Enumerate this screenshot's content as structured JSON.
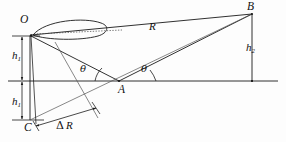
{
  "figure": {
    "type": "geometry-diagram",
    "background_color": "#fdfdfd",
    "line_color": "#1a1a1a",
    "dotted_color": "#555555"
  },
  "points": {
    "O": {
      "label": "O",
      "x": 30,
      "y": 36,
      "label_x": 20,
      "label_y": 16,
      "role": "transmitter"
    },
    "A": {
      "label": "A",
      "x": 119,
      "y": 81,
      "label_x": 115,
      "label_y": 84,
      "role": "ground-reflection-point"
    },
    "B": {
      "label": "B",
      "x": 252,
      "y": 14,
      "label_x": 248,
      "label_y": 2,
      "role": "receiver"
    },
    "C": {
      "label": "C",
      "x": 30,
      "y": 120,
      "label_x": 22,
      "label_y": 122,
      "role": "image-of-transmitter"
    }
  },
  "quantities": {
    "R": {
      "label": "R",
      "x": 150,
      "y": 22,
      "meaning": "direct path length O to B"
    },
    "h1_upper": {
      "base": "h",
      "sub": "1",
      "x": 15,
      "y": 50,
      "meaning": "transmitter height above ground"
    },
    "h1_lower": {
      "base": "h",
      "sub": "1",
      "x": 15,
      "y": 96,
      "meaning": "image depth below ground"
    },
    "h2": {
      "base": "h",
      "sub": "2",
      "x": 248,
      "y": 42,
      "meaning": "receiver height above ground"
    },
    "delta_R": {
      "delta": "Δ",
      "base": "R",
      "x": 58,
      "y": 121,
      "meaning": "path length difference"
    }
  },
  "angles": {
    "theta_left": {
      "symbol": "θ",
      "x": 82,
      "y": 65,
      "meaning": "grazing angle of incident ray at A"
    },
    "theta_right": {
      "symbol": "θ",
      "x": 142,
      "y": 65,
      "meaning": "grazing angle of reflected ray at A"
    }
  },
  "features": {
    "lobe": {
      "name": "antenna-beam-lobe",
      "from_x": 32,
      "from_y": 34,
      "to_x": 106,
      "to_y": 27
    },
    "boresight": {
      "name": "boresight-dotted-axis",
      "from_x": 33,
      "from_y": 35,
      "to_x": 120,
      "to_y": 31
    },
    "ground_line": {
      "name": "ground-plane",
      "x1": 8,
      "y1": 81,
      "x2": 278,
      "y2": 81
    }
  }
}
